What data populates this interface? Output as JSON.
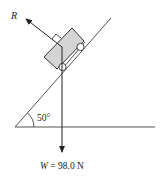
{
  "diagram": {
    "type": "free-body diagram",
    "labels": {
      "normal_force": "R",
      "angle": "50°",
      "weight": "W = 98.0 N"
    },
    "weight_symbol": "W",
    "weight_value": "98.0 N",
    "incline_angle_deg": 50,
    "colors": {
      "line": "#333333",
      "block_fill": "#d4d4d4",
      "background": "#ffffff"
    }
  }
}
